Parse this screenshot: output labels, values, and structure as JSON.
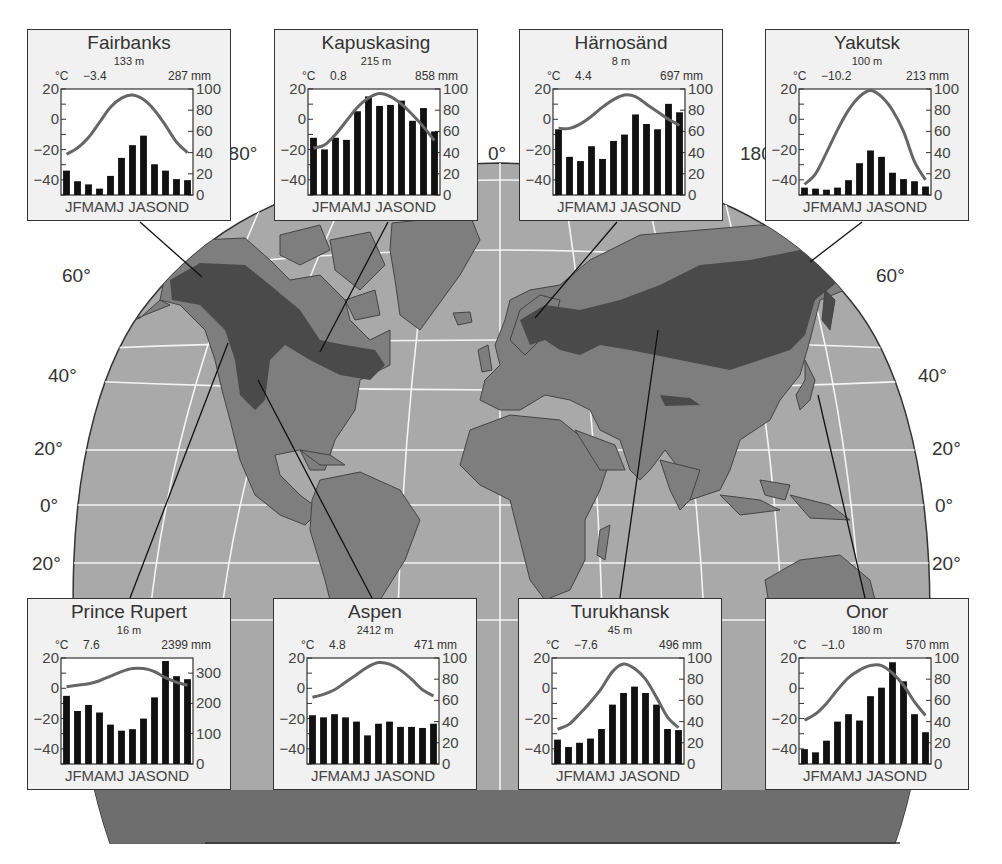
{
  "figure": {
    "map": {
      "latitude_labels_left": [
        "60°",
        "40°",
        "20°",
        "0°",
        "20°"
      ],
      "latitude_labels_right": [
        "60°",
        "40°",
        "20°",
        "0°",
        "20°"
      ],
      "longitude_labels_top": [
        "180°",
        "0°",
        "180°"
      ],
      "colors": {
        "ocean": "#a9a9a9",
        "land": "#7e7e7e",
        "boreal": "#4a4a4a",
        "grid": "#f4f4f4",
        "outline": "#333333"
      }
    },
    "months": [
      "J",
      "F",
      "M",
      "A",
      "M",
      "J",
      "J",
      "A",
      "S",
      "O",
      "N",
      "D"
    ],
    "month_axis_label": "JFMAMJ JASOND",
    "temp_unit": "°C",
    "prec_unit": "mm"
  },
  "chart_data": [
    {
      "type": "bar+line",
      "title": "Fairbanks",
      "elevation": "133 m",
      "mean_temp_label": "−3.4",
      "annual_precip_label": "287",
      "temp_axis": {
        "label": "°C",
        "ticks": [
          "20",
          "0",
          "−20",
          "−40"
        ],
        "range": [
          -50,
          20
        ]
      },
      "precip_axis": {
        "label": "mm",
        "ticks": [
          "100",
          "80",
          "60",
          "40",
          "20",
          "0"
        ],
        "range": [
          0,
          100
        ]
      },
      "categories": [
        "J",
        "F",
        "M",
        "A",
        "M",
        "J",
        "J",
        "A",
        "S",
        "O",
        "N",
        "D"
      ],
      "precip_mm": [
        23,
        13,
        10,
        6,
        18,
        35,
        47,
        56,
        29,
        23,
        15,
        14
      ],
      "temp_c": [
        -23,
        -19,
        -12,
        -2,
        8,
        14,
        16,
        13,
        6,
        -4,
        -15,
        -22
      ]
    },
    {
      "type": "bar+line",
      "title": "Kapuskasing",
      "elevation": "215 m",
      "mean_temp_label": "0.8",
      "annual_precip_label": "858",
      "temp_axis": {
        "label": "°C",
        "ticks": [
          "20",
          "0",
          "−20",
          "−40"
        ],
        "range": [
          -50,
          20
        ]
      },
      "precip_axis": {
        "label": "mm",
        "ticks": [
          "100",
          "80",
          "60",
          "40",
          "20",
          "0"
        ],
        "range": [
          0,
          100
        ]
      },
      "categories": [
        "J",
        "F",
        "M",
        "A",
        "M",
        "J",
        "J",
        "A",
        "S",
        "O",
        "N",
        "D"
      ],
      "precip_mm": [
        54,
        43,
        54,
        52,
        79,
        93,
        84,
        85,
        89,
        70,
        82,
        60
      ],
      "temp_c": [
        -19,
        -17,
        -10,
        -1,
        8,
        14,
        17,
        15,
        10,
        3,
        -5,
        -14
      ]
    },
    {
      "type": "bar+line",
      "title": "Härnosänd",
      "elevation": "8 m",
      "mean_temp_label": "4.4",
      "annual_precip_label": "697",
      "temp_axis": {
        "label": "°C",
        "ticks": [
          "20",
          "0",
          "−20",
          "−40"
        ],
        "range": [
          -50,
          20
        ]
      },
      "precip_axis": {
        "label": "mm",
        "ticks": [
          "100",
          "80",
          "60",
          "40",
          "20",
          "0"
        ],
        "range": [
          0,
          100
        ]
      },
      "categories": [
        "J",
        "F",
        "M",
        "A",
        "M",
        "J",
        "J",
        "A",
        "S",
        "O",
        "N",
        "D"
      ],
      "precip_mm": [
        62,
        36,
        32,
        46,
        34,
        51,
        57,
        76,
        67,
        62,
        86,
        78
      ],
      "temp_c": [
        -6,
        -6,
        -3,
        2,
        8,
        13,
        16,
        15,
        10,
        5,
        0,
        -4
      ]
    },
    {
      "type": "bar+line",
      "title": "Yakutsk",
      "elevation": "100 m",
      "mean_temp_label": "−10.2",
      "annual_precip_label": "213",
      "temp_axis": {
        "label": "°C",
        "ticks": [
          "20",
          "0",
          "−20",
          "−40"
        ],
        "range": [
          -50,
          20
        ]
      },
      "precip_axis": {
        "label": "mm",
        "ticks": [
          "100",
          "80",
          "60",
          "40",
          "20",
          "0"
        ],
        "range": [
          0,
          100
        ]
      },
      "categories": [
        "J",
        "F",
        "M",
        "A",
        "M",
        "J",
        "J",
        "A",
        "S",
        "O",
        "N",
        "D"
      ],
      "precip_mm": [
        7,
        6,
        5,
        7,
        14,
        30,
        42,
        36,
        21,
        15,
        13,
        8
      ],
      "temp_c": [
        -43,
        -36,
        -22,
        -7,
        6,
        15,
        19,
        15,
        6,
        -8,
        -28,
        -40
      ]
    },
    {
      "type": "bar+line",
      "title": "Prince Rupert",
      "elevation": "16 m",
      "mean_temp_label": "7.6",
      "annual_precip_label": "2399",
      "temp_axis": {
        "label": "°C",
        "ticks": [
          "20",
          "0",
          "−20",
          "−40"
        ],
        "range": [
          -50,
          20
        ]
      },
      "precip_axis": {
        "label": "mm",
        "ticks": [
          "300",
          "200",
          "100",
          "0"
        ],
        "range": [
          0,
          350
        ]
      },
      "categories": [
        "J",
        "F",
        "M",
        "A",
        "M",
        "J",
        "J",
        "A",
        "S",
        "O",
        "N",
        "D"
      ],
      "precip_mm": [
        225,
        175,
        195,
        170,
        130,
        110,
        115,
        150,
        220,
        340,
        290,
        280
      ],
      "temp_c": [
        1,
        2,
        3,
        5,
        8,
        11,
        13,
        13,
        11,
        7,
        4,
        2
      ]
    },
    {
      "type": "bar+line",
      "title": "Aspen",
      "elevation": "2412 m",
      "mean_temp_label": "4.8",
      "annual_precip_label": "471",
      "temp_axis": {
        "label": "°C",
        "ticks": [
          "20",
          "0",
          "−20",
          "−40"
        ],
        "range": [
          -50,
          20
        ]
      },
      "precip_axis": {
        "label": "mm",
        "ticks": [
          "100",
          "80",
          "60",
          "40",
          "20",
          "0"
        ],
        "range": [
          0,
          100
        ]
      },
      "categories": [
        "J",
        "F",
        "M",
        "A",
        "M",
        "J",
        "J",
        "A",
        "S",
        "O",
        "N",
        "D"
      ],
      "precip_mm": [
        46,
        44,
        47,
        44,
        40,
        27,
        38,
        40,
        35,
        35,
        34,
        38
      ],
      "temp_c": [
        -6,
        -4,
        -1,
        4,
        9,
        14,
        17,
        16,
        12,
        6,
        -1,
        -5
      ]
    },
    {
      "type": "bar+line",
      "title": "Turukhansk",
      "elevation": "45 m",
      "mean_temp_label": "−7.6",
      "annual_precip_label": "496",
      "temp_axis": {
        "label": "°C",
        "ticks": [
          "20",
          "0",
          "−20",
          "−40"
        ],
        "range": [
          -50,
          20
        ]
      },
      "precip_axis": {
        "label": "mm",
        "ticks": [
          "100",
          "80",
          "60",
          "40",
          "20",
          "0"
        ],
        "range": [
          0,
          100
        ]
      },
      "categories": [
        "J",
        "F",
        "M",
        "A",
        "M",
        "J",
        "J",
        "A",
        "S",
        "O",
        "N",
        "D"
      ],
      "precip_mm": [
        23,
        16,
        20,
        24,
        33,
        56,
        67,
        73,
        67,
        56,
        33,
        32
      ],
      "temp_c": [
        -27,
        -24,
        -17,
        -9,
        0,
        11,
        16,
        13,
        6,
        -6,
        -19,
        -26
      ]
    },
    {
      "type": "bar+line",
      "title": "Onor",
      "elevation": "180 m",
      "mean_temp_label": "−1.0",
      "annual_precip_label": "570",
      "temp_axis": {
        "label": "°C",
        "ticks": [
          "20",
          "0",
          "−20",
          "−40"
        ],
        "range": [
          -50,
          20
        ]
      },
      "precip_axis": {
        "label": "mm",
        "ticks": [
          "100",
          "80",
          "60",
          "40",
          "20",
          "0"
        ],
        "range": [
          0,
          100
        ]
      },
      "categories": [
        "J",
        "F",
        "M",
        "A",
        "M",
        "J",
        "J",
        "A",
        "S",
        "O",
        "N",
        "D"
      ],
      "precip_mm": [
        14,
        11,
        22,
        40,
        47,
        41,
        64,
        72,
        96,
        78,
        47,
        30
      ],
      "temp_c": [
        -21,
        -17,
        -10,
        -1,
        7,
        12,
        15,
        15,
        10,
        2,
        -9,
        -18
      ]
    }
  ],
  "layout": {
    "boxes": [
      {
        "x": 27,
        "y": 29
      },
      {
        "x": 274,
        "y": 29
      },
      {
        "x": 519,
        "y": 29
      },
      {
        "x": 765,
        "y": 29
      },
      {
        "x": 27,
        "y": 598
      },
      {
        "x": 273,
        "y": 598
      },
      {
        "x": 518,
        "y": 598
      },
      {
        "x": 765,
        "y": 598
      }
    ]
  }
}
